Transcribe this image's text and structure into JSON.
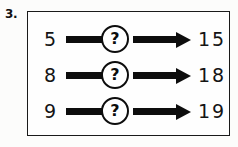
{
  "worksheet": {
    "question_number": "3.",
    "unknown_symbol": "?",
    "arrow_icon": "right-arrow-icon",
    "colors": {
      "ink": "#0d0d0d",
      "paper": "#fefefe",
      "border": "#1a1a1a"
    },
    "rows": [
      {
        "input": "5",
        "operation": "?",
        "output": "15"
      },
      {
        "input": "8",
        "operation": "?",
        "output": "18"
      },
      {
        "input": "9",
        "operation": "?",
        "output": "19"
      }
    ]
  }
}
